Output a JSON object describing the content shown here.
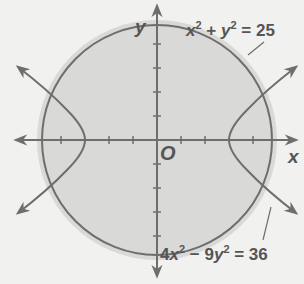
{
  "figure": {
    "axes": {
      "x_label": "x",
      "y_label": "y",
      "origin_label": "O",
      "unit_px": 24,
      "tick_values": [
        -4,
        -3,
        -2,
        -1,
        1,
        2,
        3,
        4
      ]
    },
    "curves": [
      {
        "name": "circle",
        "equation_parts": {
          "a": "x",
          "a_exp": "2",
          "op": " + ",
          "b": "y",
          "b_exp": "2",
          "rhs": " = 25"
        },
        "radius": 5,
        "shaded_interior": true
      },
      {
        "name": "hyperbola",
        "equation_parts": {
          "c1": "4",
          "a": "x",
          "a_exp": "2",
          "op": " − ",
          "c2": "9",
          "b": "y",
          "b_exp": "2",
          "rhs": " = 36"
        },
        "vertices": [
          [
            -3,
            0
          ],
          [
            3,
            0
          ]
        ]
      }
    ],
    "colors": {
      "background": "#f1f1ef",
      "shade": "#d9d9d7",
      "stroke": "#6e6e6e",
      "text": "#555555"
    }
  }
}
